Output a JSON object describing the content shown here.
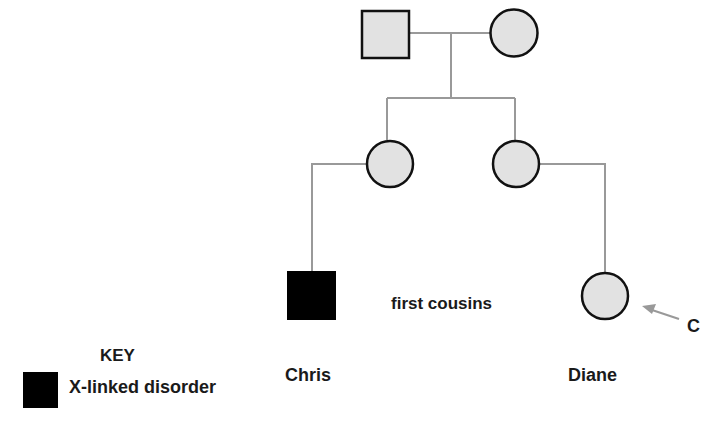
{
  "diagram": {
    "type": "pedigree",
    "colors": {
      "unaffected_fill": "#e2e2e2",
      "affected_fill": "#000000",
      "outline": "#111111",
      "line": "#999999",
      "arrow": "#999999"
    },
    "individuals": [
      {
        "id": "grandfather",
        "sex": "male",
        "affected": false,
        "generation": 1
      },
      {
        "id": "grandmother",
        "sex": "female",
        "affected": false,
        "generation": 1
      },
      {
        "id": "mother-of-chris",
        "sex": "female",
        "affected": false,
        "generation": 2
      },
      {
        "id": "mother-of-diane",
        "sex": "female",
        "affected": false,
        "generation": 2
      },
      {
        "id": "chris",
        "sex": "male",
        "affected": true,
        "generation": 3
      },
      {
        "id": "diane",
        "sex": "female",
        "affected": false,
        "generation": 3,
        "proband": true
      }
    ],
    "relationship_label": "first cousins",
    "arrow_label": "C"
  },
  "labels": {
    "chris": "Chris",
    "diane": "Diane",
    "relationship": "first cousins",
    "arrow": "C"
  },
  "key": {
    "title": "KEY",
    "items": [
      {
        "symbol": "filled-square",
        "label": "X-linked disorder"
      }
    ]
  }
}
